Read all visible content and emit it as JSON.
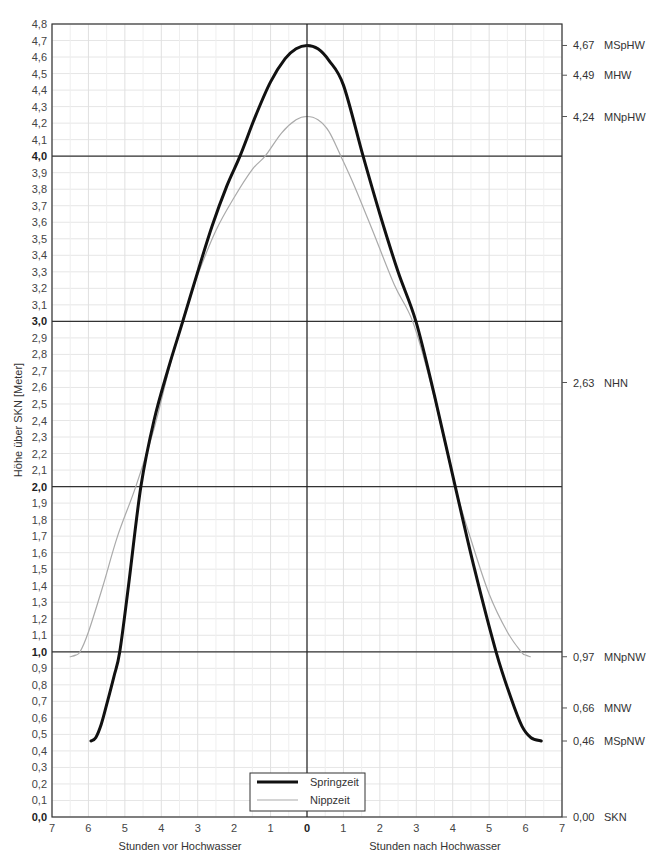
{
  "chart_data": {
    "type": "line",
    "title": "",
    "xlabel_left": "Stunden vor Hochwasser",
    "xlabel_right": "Stunden nach Hochwasser",
    "ylabel": "Höhe über SKN [Meter]",
    "xlim": [
      -7,
      7
    ],
    "ylim": [
      0.0,
      4.8
    ],
    "grid": true,
    "legend_position": "bottom-center",
    "x_ticks": [
      "7",
      "6",
      "5",
      "4",
      "3",
      "2",
      "1",
      "0",
      "1",
      "2",
      "3",
      "4",
      "5",
      "6",
      "7"
    ],
    "y_ticks": [
      "0,0",
      "0,1",
      "0,2",
      "0,3",
      "0,4",
      "0,5",
      "0,6",
      "0,7",
      "0,8",
      "0,9",
      "1,0",
      "1,1",
      "1,2",
      "1,3",
      "1,4",
      "1,5",
      "1,6",
      "1,7",
      "1,8",
      "1,9",
      "2,0",
      "2,1",
      "2,2",
      "2,3",
      "2,4",
      "2,5",
      "2,6",
      "2,7",
      "2,8",
      "2,9",
      "3,0",
      "3,1",
      "3,2",
      "3,3",
      "3,4",
      "3,5",
      "3,6",
      "3,7",
      "3,8",
      "3,9",
      "4,0",
      "4,1",
      "4,2",
      "4,3",
      "4,4",
      "4,5",
      "4,6",
      "4,7",
      "4,8"
    ],
    "y_bold_ticks": [
      "0,0",
      "1,0",
      "2,0",
      "3,0",
      "4,0"
    ],
    "reference_lines": [
      {
        "value": 4.67,
        "label_value": "4,67",
        "label_name": "MSpHW"
      },
      {
        "value": 4.49,
        "label_value": "4,49",
        "label_name": "MHW"
      },
      {
        "value": 4.24,
        "label_value": "4,24",
        "label_name": "MNpHW"
      },
      {
        "value": 2.63,
        "label_value": "2,63",
        "label_name": "NHN"
      },
      {
        "value": 0.97,
        "label_value": "0,97",
        "label_name": "MNpNW"
      },
      {
        "value": 0.66,
        "label_value": "0,66",
        "label_name": "MNW"
      },
      {
        "value": 0.46,
        "label_value": "0,46",
        "label_name": "MSpNW"
      },
      {
        "value": 0.0,
        "label_value": "0,00",
        "label_name": "SKN"
      }
    ],
    "series": [
      {
        "name": "Springzeit",
        "color": "#111111",
        "width": 3,
        "x": [
          -5.93,
          -5.8,
          -5.65,
          -5.5,
          -5.3,
          -5.14,
          -4.9,
          -4.56,
          -4.2,
          -3.8,
          -3.41,
          -3.0,
          -2.6,
          -2.2,
          -1.84,
          -1.4,
          -1.0,
          -0.6,
          -0.3,
          0.0,
          0.3,
          0.6,
          1.0,
          1.54,
          2.0,
          2.5,
          2.99,
          3.5,
          4.07,
          4.6,
          5.19,
          5.6,
          5.9,
          6.15,
          6.43
        ],
        "y": [
          0.46,
          0.48,
          0.56,
          0.68,
          0.85,
          1.0,
          1.4,
          2.0,
          2.4,
          2.72,
          3.0,
          3.3,
          3.58,
          3.82,
          4.0,
          4.25,
          4.45,
          4.59,
          4.65,
          4.67,
          4.65,
          4.58,
          4.43,
          4.0,
          3.65,
          3.3,
          3.0,
          2.55,
          2.0,
          1.5,
          1.0,
          0.72,
          0.55,
          0.48,
          0.46
        ]
      },
      {
        "name": "Nippzeit",
        "color": "#aaaaaa",
        "width": 1.2,
        "x": [
          -6.5,
          -6.35,
          -6.23,
          -6.0,
          -5.6,
          -5.2,
          -4.7,
          -4.2,
          -3.8,
          -3.43,
          -3.0,
          -2.5,
          -2.0,
          -1.5,
          -1.15,
          -0.7,
          -0.3,
          0.0,
          0.3,
          0.6,
          0.93,
          1.3,
          1.8,
          2.4,
          2.9,
          3.4,
          4.07,
          4.5,
          5.0,
          5.5,
          5.88,
          6.0,
          6.13
        ],
        "y": [
          0.97,
          0.98,
          1.0,
          1.12,
          1.4,
          1.7,
          2.0,
          2.35,
          2.7,
          3.0,
          3.28,
          3.55,
          3.75,
          3.92,
          4.0,
          4.14,
          4.22,
          4.24,
          4.22,
          4.15,
          4.0,
          3.82,
          3.55,
          3.22,
          3.0,
          2.62,
          2.0,
          1.68,
          1.35,
          1.12,
          1.0,
          0.98,
          0.97
        ]
      }
    ]
  },
  "legend": {
    "items": [
      {
        "label": "Springzeit"
      },
      {
        "label": "Nippzeit"
      }
    ]
  },
  "axes": {
    "ylabel": "Höhe über SKN [Meter]",
    "xlabel_left": "Stunden vor Hochwasser",
    "xlabel_right": "Stunden nach Hochwasser"
  }
}
